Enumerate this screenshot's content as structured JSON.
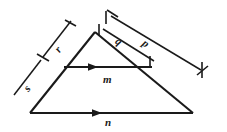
{
  "figure": {
    "kind": "geometry-diagram",
    "background_color": "#ffffff",
    "ink_color": "#1a1a1a",
    "labels": {
      "m": "m",
      "n": "n",
      "r": "r",
      "s": "s",
      "q": "q",
      "p": "p"
    },
    "flow_lines": [
      {
        "id": "m",
        "label": "m",
        "direction": "right",
        "from": [
          64,
          67
        ],
        "to": [
          152,
          67
        ]
      },
      {
        "id": "n",
        "label": "n",
        "direction": "right",
        "from": [
          30,
          113
        ],
        "to": [
          193,
          113
        ]
      }
    ],
    "dimensions": [
      {
        "id": "r",
        "label": "r",
        "side": "left",
        "from": [
          71,
          21
        ],
        "to": [
          43,
          57
        ]
      },
      {
        "id": "s",
        "label": "s",
        "side": "left",
        "from": [
          43,
          57
        ],
        "to": [
          14,
          95
        ]
      },
      {
        "id": "q",
        "label": "q",
        "side": "right",
        "from": [
          103,
          29
        ],
        "to": [
          155,
          61
        ]
      },
      {
        "id": "p",
        "label": "p",
        "side": "right",
        "from": [
          111,
          16
        ],
        "to": [
          200,
          70
        ]
      }
    ],
    "triangle": {
      "apex": [
        95,
        32
      ],
      "bottom_left": [
        30,
        113
      ],
      "bottom_right": [
        193,
        113
      ]
    }
  }
}
